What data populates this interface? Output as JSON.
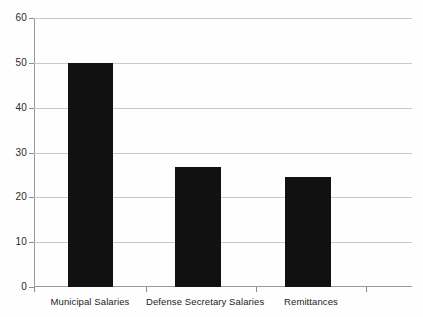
{
  "chart_data": {
    "type": "bar",
    "title": "",
    "subtitle": "",
    "xlabel": "",
    "ylabel": "",
    "categories": [
      "Municipal Salaries",
      "Defense Secretary Salaries",
      "Remittances"
    ],
    "values": [
      50,
      26.7,
      24.5
    ],
    "series": [
      {
        "name": "",
        "values": [
          50,
          26.7,
          24.5
        ]
      }
    ],
    "ylim": [
      0,
      60
    ],
    "ytick_labels": [
      "0",
      "10",
      "20",
      "30",
      "40",
      "50",
      "60"
    ],
    "ytick_values": [
      0,
      10,
      20,
      30,
      40,
      50,
      60
    ],
    "grid": "horizontal",
    "legend": "none",
    "bar_color": "#111111",
    "gridline_color": "#c8c8c8",
    "axis_color": "#9a9a9a",
    "background_color": "#ffffff"
  }
}
